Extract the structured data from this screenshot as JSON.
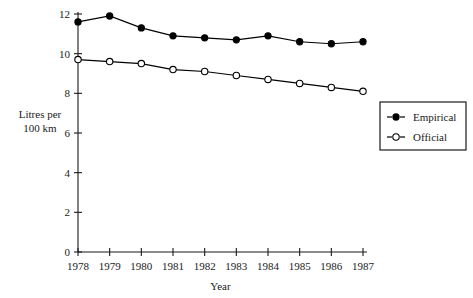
{
  "chart_data": {
    "type": "line",
    "title": "",
    "xlabel": "Year",
    "ylabel": "Litres per 100 km",
    "ylabel_lines": [
      "Litres per",
      "100 km"
    ],
    "categories": [
      "1978",
      "1979",
      "1980",
      "1981",
      "1982",
      "1983",
      "1984",
      "1985",
      "1986",
      "1987"
    ],
    "x": [
      1978,
      1979,
      1980,
      1981,
      1982,
      1983,
      1984,
      1985,
      1986,
      1987
    ],
    "ylim": [
      0,
      12
    ],
    "yticks": [
      0,
      2,
      4,
      6,
      8,
      10,
      12
    ],
    "ytick_labels": [
      "0",
      "2",
      "4",
      "6",
      "8",
      "10",
      "12"
    ],
    "grid": false,
    "legend_position": "right",
    "series": [
      {
        "name": "Empirical",
        "marker": "filled-circle",
        "linestyle": "solid",
        "color": "#000000",
        "values": [
          11.6,
          11.9,
          11.3,
          10.9,
          10.8,
          10.7,
          10.9,
          10.6,
          10.5,
          10.6
        ]
      },
      {
        "name": "Official",
        "marker": "open-circle",
        "linestyle": "dashed",
        "color": "#000000",
        "values": [
          9.7,
          9.6,
          9.5,
          9.2,
          9.1,
          8.9,
          8.7,
          8.5,
          8.3,
          8.1
        ]
      }
    ]
  },
  "legend": {
    "entries": [
      {
        "label": "Empirical",
        "marker": "filled-circle"
      },
      {
        "label": "Official",
        "marker": "open-circle"
      }
    ]
  },
  "colors": {
    "axis": "#1a1a1a",
    "series": "#000000",
    "background": "#ffffff"
  }
}
